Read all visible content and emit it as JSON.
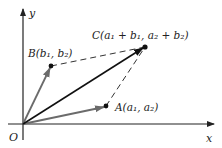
{
  "diagram": {
    "axes": {
      "x_label": "x",
      "y_label": "y",
      "origin_label": "O"
    },
    "points": {
      "A": {
        "label": "A(a₁, a₂)"
      },
      "B": {
        "label": "B(b₁, b₂)"
      },
      "C": {
        "label": "C(a₁ + b₁, a₂ + b₂)"
      }
    },
    "colors": {
      "axis": "#222222",
      "vector_a_b": "#6b6b6b",
      "vector_c": "#111111",
      "dashed": "#333333"
    }
  }
}
